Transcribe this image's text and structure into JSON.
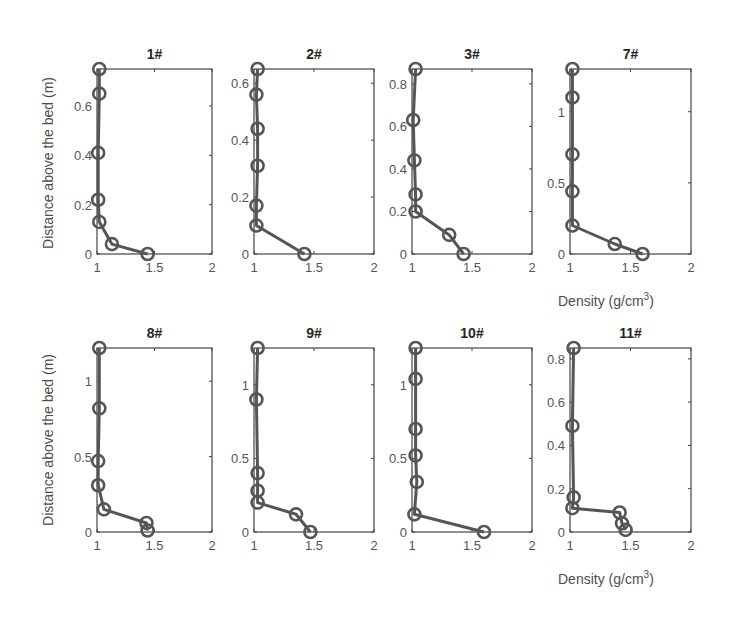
{
  "figure": {
    "ylabel": "Distance above the bed (m)",
    "xlabel": "Density (g/cm",
    "xlabel_sup": "3",
    "xlabel_close": ")",
    "line_color": "#555555",
    "axis_color": "#444444"
  },
  "chart_data": [
    {
      "type": "line",
      "title": "1#",
      "xlim": [
        1,
        2
      ],
      "ylim": [
        0,
        0.75
      ],
      "xticks": [
        1,
        1.5,
        2
      ],
      "yticks": [
        0,
        0.2,
        0.4,
        0.6
      ],
      "ytick_labels": [
        "0",
        "0.2",
        "0.4",
        "0.6"
      ],
      "x": [
        1.02,
        1.02,
        1.01,
        1.01,
        1.02,
        1.13,
        1.44
      ],
      "y": [
        0.75,
        0.65,
        0.41,
        0.22,
        0.13,
        0.04,
        0.0
      ],
      "xlabel": "",
      "ylabel": "Distance above the bed (m)"
    },
    {
      "type": "line",
      "title": "2#",
      "xlim": [
        1,
        2
      ],
      "ylim": [
        0,
        0.65
      ],
      "xticks": [
        1,
        1.5,
        2
      ],
      "yticks": [
        0,
        0.2,
        0.4,
        0.6
      ],
      "ytick_labels": [
        "0",
        "0.2",
        "0.4",
        "0.6"
      ],
      "x": [
        1.03,
        1.02,
        1.03,
        1.03,
        1.02,
        1.02,
        1.42
      ],
      "y": [
        0.65,
        0.56,
        0.44,
        0.31,
        0.17,
        0.1,
        0.0
      ],
      "xlabel": "",
      "ylabel": ""
    },
    {
      "type": "line",
      "title": "3#",
      "xlim": [
        1,
        2
      ],
      "ylim": [
        0,
        0.87
      ],
      "xticks": [
        1,
        1.5,
        2
      ],
      "yticks": [
        0,
        0.2,
        0.4,
        0.6,
        0.8
      ],
      "ytick_labels": [
        "0",
        "0.2",
        "0.4",
        "0.6",
        "0.8"
      ],
      "x": [
        1.03,
        1.01,
        1.02,
        1.03,
        1.03,
        1.31,
        1.43
      ],
      "y": [
        0.87,
        0.63,
        0.44,
        0.28,
        0.2,
        0.09,
        0.0
      ],
      "xlabel": "",
      "ylabel": ""
    },
    {
      "type": "line",
      "title": "7#",
      "xlim": [
        1,
        2
      ],
      "ylim": [
        0,
        1.3
      ],
      "xticks": [
        1,
        1.5,
        2
      ],
      "yticks": [
        0,
        0.5,
        1
      ],
      "ytick_labels": [
        "0",
        "0.5",
        "1"
      ],
      "x": [
        1.02,
        1.02,
        1.02,
        1.02,
        1.02,
        1.37,
        1.6
      ],
      "y": [
        1.3,
        1.1,
        0.7,
        0.44,
        0.2,
        0.07,
        0.0
      ],
      "xlabel": "Density (g/cm3)",
      "ylabel": ""
    },
    {
      "type": "line",
      "title": "8#",
      "xlim": [
        1,
        2
      ],
      "ylim": [
        0,
        1.22
      ],
      "xticks": [
        1,
        1.5,
        2
      ],
      "yticks": [
        0,
        0.5,
        1
      ],
      "ytick_labels": [
        "0",
        "0.5",
        "1"
      ],
      "x": [
        1.02,
        1.02,
        1.01,
        1.01,
        1.06,
        1.43,
        1.44
      ],
      "y": [
        1.22,
        0.82,
        0.47,
        0.31,
        0.15,
        0.06,
        0.01
      ],
      "xlabel": "",
      "ylabel": "Distance above the bed (m)"
    },
    {
      "type": "line",
      "title": "9#",
      "xlim": [
        1,
        2
      ],
      "ylim": [
        0,
        1.25
      ],
      "xticks": [
        1,
        1.5,
        2
      ],
      "yticks": [
        0,
        0.5,
        1
      ],
      "ytick_labels": [
        "0",
        "0.5",
        "1"
      ],
      "x": [
        1.03,
        1.02,
        1.03,
        1.03,
        1.03,
        1.35,
        1.47
      ],
      "y": [
        1.25,
        0.9,
        0.4,
        0.28,
        0.2,
        0.12,
        0.0
      ],
      "xlabel": "",
      "ylabel": ""
    },
    {
      "type": "line",
      "title": "10#",
      "xlim": [
        1,
        2
      ],
      "ylim": [
        0,
        1.25
      ],
      "xticks": [
        1,
        1.5,
        2
      ],
      "yticks": [
        0,
        0.5,
        1
      ],
      "ytick_labels": [
        "0",
        "0.5",
        "1"
      ],
      "x": [
        1.03,
        1.03,
        1.03,
        1.03,
        1.04,
        1.02,
        1.6
      ],
      "y": [
        1.25,
        1.04,
        0.7,
        0.52,
        0.34,
        0.12,
        0.0
      ],
      "xlabel": "",
      "ylabel": ""
    },
    {
      "type": "line",
      "title": "11#",
      "xlim": [
        1,
        2
      ],
      "ylim": [
        0,
        0.85
      ],
      "xticks": [
        1,
        1.5,
        2
      ],
      "yticks": [
        0,
        0.2,
        0.4,
        0.6,
        0.8
      ],
      "ytick_labels": [
        "0",
        "0.2",
        "0.4",
        "0.6",
        "0.8"
      ],
      "x": [
        1.03,
        1.02,
        1.03,
        1.02,
        1.41,
        1.43,
        1.46
      ],
      "y": [
        0.85,
        0.49,
        0.16,
        0.11,
        0.09,
        0.04,
        0.01
      ],
      "xlabel": "Density (g/cm3)",
      "ylabel": ""
    }
  ]
}
